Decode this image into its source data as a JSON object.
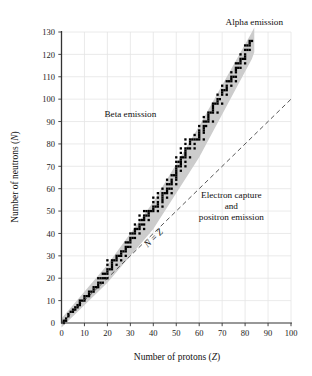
{
  "chart_data": {
    "type": "scatter",
    "title": "",
    "xlabel": "Number of protons (Z)",
    "ylabel": "Number of neutrons (N)",
    "xlabel_main": "Number of protons",
    "xlabel_sym": "Z",
    "ylabel_main": "Number of neutrons",
    "ylabel_sym": "N",
    "xlim": [
      0,
      100
    ],
    "ylim": [
      0,
      130
    ],
    "xticks": [
      0,
      10,
      20,
      30,
      40,
      50,
      60,
      70,
      80,
      90,
      100
    ],
    "yticks": [
      0,
      10,
      20,
      30,
      40,
      50,
      60,
      70,
      80,
      90,
      100,
      110,
      120,
      130
    ],
    "xtick_labels": [
      "0",
      "10",
      "20",
      "30",
      "40",
      "50",
      "60",
      "70",
      "80",
      "90",
      "100"
    ],
    "ytick_labels": [
      "0",
      "10",
      "20",
      "30",
      "40",
      "50",
      "60",
      "70",
      "80",
      "90",
      "100",
      "110",
      "120",
      "130"
    ],
    "grid": true,
    "grid_color": "#e4e4e4",
    "axis_color": "#333333",
    "band_color": "#cccccc",
    "point_color": "#000000",
    "legend_position": "none",
    "annotations": [
      {
        "name": "alpha-emission",
        "text": "Alpha emission",
        "x": 84,
        "y": 133
      },
      {
        "name": "beta-emission",
        "text": "Beta emission",
        "x": 30,
        "y": 92
      },
      {
        "name": "electron-capture",
        "text": "Electron capture",
        "x": 74,
        "y": 56
      },
      {
        "name": "and",
        "text": "and",
        "x": 74,
        "y": 51
      },
      {
        "name": "positron-emission",
        "text": "positron emission",
        "x": 74,
        "y": 46
      },
      {
        "name": "n-equals-z",
        "text": "N = Z",
        "x": 41,
        "y": 37
      }
    ],
    "reference_line": {
      "name": "N = Z",
      "label": "N = Z",
      "style": "dashed",
      "from": [
        0,
        0
      ],
      "to": [
        100,
        100
      ]
    },
    "band": {
      "name": "band-of-stability",
      "lower_bound": [
        [
          0,
          -2
        ],
        [
          20,
          18
        ],
        [
          40,
          42
        ],
        [
          60,
          74
        ],
        [
          83,
          118
        ],
        [
          84,
          121
        ]
      ],
      "upper_bound": [
        [
          0,
          2
        ],
        [
          20,
          26
        ],
        [
          40,
          54
        ],
        [
          60,
          88
        ],
        [
          83,
          130
        ],
        [
          84,
          132
        ]
      ]
    },
    "series": [
      {
        "name": "stable nuclides",
        "points": [
          [
            1,
            0
          ],
          [
            1,
            1
          ],
          [
            2,
            1
          ],
          [
            2,
            2
          ],
          [
            3,
            3
          ],
          [
            3,
            4
          ],
          [
            4,
            5
          ],
          [
            5,
            5
          ],
          [
            5,
            6
          ],
          [
            6,
            6
          ],
          [
            6,
            7
          ],
          [
            7,
            7
          ],
          [
            7,
            8
          ],
          [
            8,
            8
          ],
          [
            8,
            9
          ],
          [
            8,
            10
          ],
          [
            9,
            10
          ],
          [
            10,
            10
          ],
          [
            10,
            11
          ],
          [
            10,
            12
          ],
          [
            11,
            12
          ],
          [
            12,
            12
          ],
          [
            12,
            13
          ],
          [
            12,
            14
          ],
          [
            13,
            14
          ],
          [
            14,
            14
          ],
          [
            14,
            15
          ],
          [
            14,
            16
          ],
          [
            15,
            16
          ],
          [
            16,
            16
          ],
          [
            16,
            17
          ],
          [
            16,
            18
          ],
          [
            16,
            20
          ],
          [
            17,
            18
          ],
          [
            17,
            20
          ],
          [
            18,
            18
          ],
          [
            18,
            20
          ],
          [
            18,
            22
          ],
          [
            19,
            20
          ],
          [
            19,
            22
          ],
          [
            20,
            20
          ],
          [
            20,
            22
          ],
          [
            20,
            23
          ],
          [
            20,
            24
          ],
          [
            20,
            26
          ],
          [
            20,
            28
          ],
          [
            21,
            24
          ],
          [
            22,
            24
          ],
          [
            22,
            25
          ],
          [
            22,
            26
          ],
          [
            22,
            27
          ],
          [
            22,
            28
          ],
          [
            23,
            28
          ],
          [
            24,
            26
          ],
          [
            24,
            28
          ],
          [
            24,
            29
          ],
          [
            24,
            30
          ],
          [
            25,
            30
          ],
          [
            26,
            28
          ],
          [
            26,
            30
          ],
          [
            26,
            31
          ],
          [
            26,
            32
          ],
          [
            27,
            32
          ],
          [
            28,
            30
          ],
          [
            28,
            32
          ],
          [
            28,
            33
          ],
          [
            28,
            34
          ],
          [
            28,
            36
          ],
          [
            29,
            34
          ],
          [
            29,
            36
          ],
          [
            30,
            34
          ],
          [
            30,
            36
          ],
          [
            30,
            37
          ],
          [
            30,
            38
          ],
          [
            30,
            40
          ],
          [
            31,
            38
          ],
          [
            31,
            40
          ],
          [
            32,
            38
          ],
          [
            32,
            40
          ],
          [
            32,
            41
          ],
          [
            32,
            42
          ],
          [
            32,
            44
          ],
          [
            33,
            42
          ],
          [
            34,
            40
          ],
          [
            34,
            42
          ],
          [
            34,
            43
          ],
          [
            34,
            44
          ],
          [
            34,
            46
          ],
          [
            34,
            48
          ],
          [
            35,
            44
          ],
          [
            35,
            46
          ],
          [
            36,
            42
          ],
          [
            36,
            44
          ],
          [
            36,
            46
          ],
          [
            36,
            47
          ],
          [
            36,
            48
          ],
          [
            36,
            50
          ],
          [
            37,
            48
          ],
          [
            37,
            50
          ],
          [
            38,
            46
          ],
          [
            38,
            48
          ],
          [
            38,
            49
          ],
          [
            38,
            50
          ],
          [
            39,
            50
          ],
          [
            40,
            50
          ],
          [
            40,
            51
          ],
          [
            40,
            52
          ],
          [
            40,
            54
          ],
          [
            40,
            56
          ],
          [
            41,
            52
          ],
          [
            42,
            50
          ],
          [
            42,
            52
          ],
          [
            42,
            53
          ],
          [
            42,
            54
          ],
          [
            42,
            56
          ],
          [
            42,
            58
          ],
          [
            44,
            52
          ],
          [
            44,
            54
          ],
          [
            44,
            55
          ],
          [
            44,
            56
          ],
          [
            44,
            57
          ],
          [
            44,
            58
          ],
          [
            44,
            60
          ],
          [
            45,
            58
          ],
          [
            46,
            56
          ],
          [
            46,
            58
          ],
          [
            46,
            59
          ],
          [
            46,
            60
          ],
          [
            46,
            62
          ],
          [
            46,
            64
          ],
          [
            47,
            60
          ],
          [
            47,
            62
          ],
          [
            48,
            58
          ],
          [
            48,
            60
          ],
          [
            48,
            62
          ],
          [
            48,
            63
          ],
          [
            48,
            64
          ],
          [
            48,
            66
          ],
          [
            49,
            66
          ],
          [
            50,
            62
          ],
          [
            50,
            64
          ],
          [
            50,
            65
          ],
          [
            50,
            66
          ],
          [
            50,
            67
          ],
          [
            50,
            68
          ],
          [
            50,
            69
          ],
          [
            50,
            70
          ],
          [
            50,
            72
          ],
          [
            50,
            74
          ],
          [
            51,
            70
          ],
          [
            51,
            72
          ],
          [
            52,
            68
          ],
          [
            52,
            70
          ],
          [
            52,
            71
          ],
          [
            52,
            72
          ],
          [
            52,
            73
          ],
          [
            52,
            74
          ],
          [
            52,
            76
          ],
          [
            52,
            78
          ],
          [
            53,
            74
          ],
          [
            54,
            70
          ],
          [
            54,
            72
          ],
          [
            54,
            74
          ],
          [
            54,
            75
          ],
          [
            54,
            76
          ],
          [
            54,
            77
          ],
          [
            54,
            78
          ],
          [
            54,
            80
          ],
          [
            54,
            82
          ],
          [
            55,
            78
          ],
          [
            56,
            74
          ],
          [
            56,
            78
          ],
          [
            56,
            80
          ],
          [
            56,
            81
          ],
          [
            56,
            82
          ],
          [
            57,
            82
          ],
          [
            58,
            78
          ],
          [
            58,
            80
          ],
          [
            58,
            82
          ],
          [
            58,
            84
          ],
          [
            59,
            82
          ],
          [
            60,
            82
          ],
          [
            60,
            83
          ],
          [
            60,
            84
          ],
          [
            60,
            85
          ],
          [
            60,
            86
          ],
          [
            60,
            88
          ],
          [
            62,
            82
          ],
          [
            62,
            85
          ],
          [
            62,
            86
          ],
          [
            62,
            87
          ],
          [
            62,
            88
          ],
          [
            62,
            90
          ],
          [
            62,
            92
          ],
          [
            63,
            88
          ],
          [
            63,
            90
          ],
          [
            64,
            90
          ],
          [
            64,
            91
          ],
          [
            64,
            92
          ],
          [
            64,
            93
          ],
          [
            64,
            94
          ],
          [
            65,
            94
          ],
          [
            66,
            90
          ],
          [
            66,
            94
          ],
          [
            66,
            95
          ],
          [
            66,
            96
          ],
          [
            66,
            97
          ],
          [
            66,
            98
          ],
          [
            67,
            98
          ],
          [
            68,
            94
          ],
          [
            68,
            98
          ],
          [
            68,
            99
          ],
          [
            68,
            100
          ],
          [
            68,
            102
          ],
          [
            69,
            100
          ],
          [
            70,
            98
          ],
          [
            70,
            102
          ],
          [
            70,
            103
          ],
          [
            70,
            104
          ],
          [
            70,
            106
          ],
          [
            71,
            104
          ],
          [
            72,
            102
          ],
          [
            72,
            104
          ],
          [
            72,
            105
          ],
          [
            72,
            106
          ],
          [
            72,
            108
          ],
          [
            73,
            108
          ],
          [
            74,
            106
          ],
          [
            74,
            108
          ],
          [
            74,
            109
          ],
          [
            74,
            110
          ],
          [
            74,
            112
          ],
          [
            75,
            110
          ],
          [
            76,
            108
          ],
          [
            76,
            110
          ],
          [
            76,
            112
          ],
          [
            76,
            113
          ],
          [
            76,
            114
          ],
          [
            76,
            116
          ],
          [
            77,
            114
          ],
          [
            77,
            116
          ],
          [
            78,
            114
          ],
          [
            78,
            116
          ],
          [
            78,
            117
          ],
          [
            78,
            118
          ],
          [
            78,
            120
          ],
          [
            79,
            118
          ],
          [
            80,
            116
          ],
          [
            80,
            118
          ],
          [
            80,
            119
          ],
          [
            80,
            120
          ],
          [
            80,
            122
          ],
          [
            80,
            124
          ],
          [
            81,
            122
          ],
          [
            81,
            124
          ],
          [
            82,
            122
          ],
          [
            82,
            124
          ],
          [
            82,
            125
          ],
          [
            82,
            126
          ],
          [
            83,
            126
          ]
        ]
      }
    ]
  },
  "figure": {
    "name": "band-of-stability-chart",
    "background": "#ffffff"
  }
}
